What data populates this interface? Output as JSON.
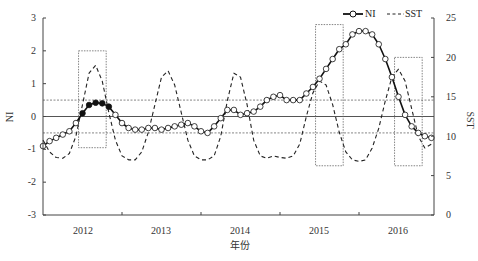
{
  "chart_data": {
    "type": "line",
    "title": "",
    "xlabel": "年份",
    "ylabel": "NI",
    "ylabel_right": "SST",
    "x_tick_labels": [
      "2012",
      "2013",
      "2014",
      "2015",
      "2016"
    ],
    "ylim": [
      -3,
      3
    ],
    "yticks": [
      -3,
      -2,
      -1,
      0,
      1,
      2,
      3
    ],
    "ylim_right": [
      0,
      25
    ],
    "yticks_right": [
      0,
      5,
      10,
      15,
      20,
      25
    ],
    "grid": false,
    "legend_position": "top-right",
    "reference_lines": {
      "zero_line": 0,
      "upper_threshold": 0.5,
      "lower_threshold": -0.5
    },
    "highlight_boxes": [
      {
        "label": "2012 event",
        "x_start_year": 2011.95,
        "x_end_year": 2012.3,
        "ni_top": 2.0,
        "ni_bottom": -0.95
      },
      {
        "label": "2015 event",
        "x_start_year": 2014.95,
        "x_end_year": 2015.3,
        "ni_top": 2.8,
        "ni_bottom": -1.5
      },
      {
        "label": "2016 event",
        "x_start_year": 2015.95,
        "x_end_year": 2016.3,
        "ni_top": 1.8,
        "ni_bottom": -1.5
      }
    ],
    "x_start": 2011.5,
    "x_step_months": 1,
    "series": [
      {
        "name": "NI",
        "axis": "left",
        "style": "solid-with-circle-markers",
        "filled_marker_range": [
          6,
          10
        ],
        "values": [
          -0.9,
          -0.75,
          -0.65,
          -0.55,
          -0.45,
          -0.2,
          0.1,
          0.35,
          0.42,
          0.4,
          0.3,
          0.05,
          -0.2,
          -0.35,
          -0.4,
          -0.4,
          -0.35,
          -0.35,
          -0.4,
          -0.35,
          -0.3,
          -0.25,
          -0.2,
          -0.3,
          -0.45,
          -0.5,
          -0.3,
          -0.05,
          0.2,
          0.2,
          0.05,
          0.1,
          0.15,
          0.3,
          0.5,
          0.6,
          0.65,
          0.5,
          0.5,
          0.5,
          0.7,
          0.9,
          1.15,
          1.45,
          1.75,
          2.05,
          2.2,
          2.5,
          2.6,
          2.6,
          2.5,
          2.2,
          1.75,
          1.2,
          0.6,
          0.05,
          -0.3,
          -0.5,
          -0.6,
          -0.65,
          -0.6
        ]
      },
      {
        "name": "SST",
        "axis": "right",
        "style": "dashed",
        "values": [
          9.5,
          8.0,
          7.3,
          7.2,
          7.8,
          10.0,
          14.0,
          18.0,
          19.0,
          17.0,
          13.0,
          9.5,
          7.5,
          7.0,
          7.0,
          8.0,
          10.5,
          14.0,
          17.5,
          18.3,
          16.5,
          13.0,
          9.5,
          7.5,
          7.0,
          7.0,
          7.5,
          10.0,
          14.5,
          18.0,
          17.5,
          14.0,
          9.5,
          7.5,
          7.2,
          7.5,
          7.3,
          7.2,
          7.5,
          9.0,
          12.5,
          15.5,
          17.0,
          16.5,
          14.0,
          10.5,
          8.0,
          7.0,
          6.8,
          7.0,
          8.5,
          11.0,
          14.5,
          17.5,
          18.5,
          17.0,
          13.5,
          10.0,
          8.5,
          9.0,
          10.0
        ]
      }
    ]
  },
  "legend": {
    "ni_label": "NI",
    "sst_label": "SST"
  },
  "axes": {
    "left_title": "NI",
    "right_title": "SST",
    "bottom_title": "年份",
    "left_ticks": [
      "3",
      "2",
      "1",
      "0",
      "-1",
      "-2",
      "-3"
    ],
    "right_ticks": [
      "25",
      "20",
      "15",
      "10",
      "5",
      "0"
    ],
    "bottom_ticks": [
      "2012",
      "2013",
      "2014",
      "2015",
      "2016"
    ]
  }
}
